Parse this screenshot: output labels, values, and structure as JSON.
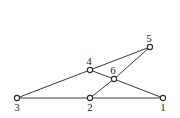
{
  "diagram": {
    "type": "graph",
    "nodes": [
      {
        "id": "1",
        "label": "1",
        "x": 163,
        "y": 98,
        "lx": 163,
        "ly": 111
      },
      {
        "id": "2",
        "label": "2",
        "x": 90,
        "y": 98,
        "lx": 90,
        "ly": 111
      },
      {
        "id": "3",
        "label": "3",
        "x": 17,
        "y": 98,
        "lx": 17,
        "ly": 111
      },
      {
        "id": "4",
        "label": "4",
        "x": 90,
        "y": 70,
        "lx": 89,
        "ly": 65
      },
      {
        "id": "5",
        "label": "5",
        "x": 150,
        "y": 47,
        "lx": 149,
        "ly": 42
      },
      {
        "id": "6",
        "label": "6",
        "x": 114,
        "y": 79,
        "lx": 113,
        "ly": 74
      }
    ],
    "edges": [
      {
        "from": "3",
        "to": "2"
      },
      {
        "from": "2",
        "to": "1"
      },
      {
        "from": "3",
        "to": "4"
      },
      {
        "from": "4",
        "to": "5"
      },
      {
        "from": "4",
        "to": "6"
      },
      {
        "from": "6",
        "to": "1"
      },
      {
        "from": "6",
        "to": "5"
      },
      {
        "from": "6",
        "to": "2"
      }
    ]
  }
}
